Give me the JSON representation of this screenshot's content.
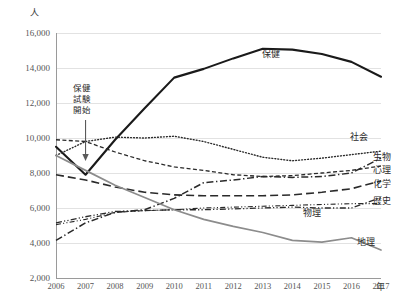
{
  "chart_data": {
    "type": "line",
    "title": "",
    "xlabel": "年",
    "ylabel": "人",
    "x": [
      2006,
      2007,
      2008,
      2009,
      2010,
      2011,
      2012,
      2013,
      2014,
      2015,
      2016,
      2017
    ],
    "xlim": [
      2006,
      2017
    ],
    "ylim": [
      2000,
      16000
    ],
    "yticks": [
      2000,
      4000,
      6000,
      8000,
      10000,
      12000,
      14000,
      16000
    ],
    "ytick_labels": [
      "2,000",
      "4,000",
      "6,000",
      "8,000",
      "10,000",
      "12,000",
      "14,000",
      "16,000"
    ],
    "xtick_labels": [
      "2006",
      "2007",
      "2008",
      "2009",
      "2010",
      "2011",
      "2012",
      "2013",
      "2014",
      "2015",
      "2016",
      "2017"
    ],
    "grid": true,
    "legend_position": "right-inline",
    "series": [
      {
        "name": "保健",
        "style": "solid-thick",
        "color": "#1a1a1a",
        "values": [
          9500,
          7900,
          9900,
          11700,
          13450,
          13950,
          14550,
          15100,
          15050,
          14800,
          14350,
          13500
        ]
      },
      {
        "name": "社会",
        "style": "dotted",
        "color": "#2a2a2a",
        "values": [
          9000,
          9800,
          10050,
          10000,
          10100,
          9800,
          9350,
          8900,
          8700,
          8850,
          9050,
          9250
        ]
      },
      {
        "name": "生物",
        "style": "dash-dot",
        "color": "#2a2a2a",
        "values": [
          4150,
          5150,
          5750,
          5900,
          6550,
          7450,
          7600,
          7800,
          7750,
          7800,
          8000,
          8850
        ]
      },
      {
        "name": "心理",
        "style": "short-dash",
        "color": "#2a2a2a",
        "values": [
          9900,
          9800,
          9200,
          8700,
          8350,
          8150,
          7900,
          7800,
          7850,
          8000,
          8150,
          8400
        ]
      },
      {
        "name": "化学",
        "style": "long-dash",
        "color": "#2a2a2a",
        "values": [
          7900,
          7600,
          7200,
          6900,
          6750,
          6700,
          6700,
          6700,
          6750,
          6900,
          7100,
          7550
        ]
      },
      {
        "name": "歴史",
        "style": "dash-dot-dot",
        "color": "#2a2a2a",
        "values": [
          5150,
          5500,
          5800,
          5850,
          5900,
          5900,
          5950,
          6000,
          6050,
          6000,
          6000,
          6600
        ]
      },
      {
        "name": "物理",
        "style": "dash-dot-dot-light",
        "color": "#2a2a2a",
        "values": [
          5050,
          5350,
          5750,
          5850,
          5900,
          6000,
          6050,
          6100,
          6150,
          6200,
          6250,
          6250
        ]
      },
      {
        "name": "地理",
        "style": "solid-gray",
        "color": "#8c8c8c",
        "values": [
          9000,
          8150,
          7300,
          6600,
          5900,
          5350,
          4950,
          4600,
          4150,
          4050,
          4300,
          3600
        ]
      }
    ],
    "annotations": [
      {
        "name": "health-exam-start",
        "text_lines": [
          "保健",
          "試験",
          "開始"
        ],
        "at_x": 2007,
        "arrow": "down"
      }
    ],
    "series_labels": [
      {
        "name": "保健",
        "x": 262,
        "y": 47
      },
      {
        "name": "社会",
        "x": 350,
        "y": 130
      },
      {
        "name": "生物",
        "x": 373,
        "y": 150
      },
      {
        "name": "心理",
        "x": 373,
        "y": 163
      },
      {
        "name": "化学",
        "x": 373,
        "y": 177
      },
      {
        "name": "歴史",
        "x": 373,
        "y": 194
      },
      {
        "name": "物理",
        "x": 303,
        "y": 206
      },
      {
        "name": "地理",
        "x": 357,
        "y": 235
      }
    ]
  }
}
